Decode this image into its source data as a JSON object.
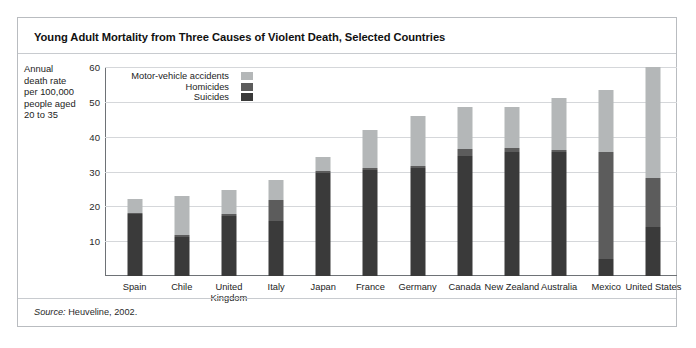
{
  "figure": {
    "title": "Young Adult Mortality from Three Causes of Violent Death, Selected Countries",
    "source_lead": "Source:",
    "source_text": " Heuveline, 2002."
  },
  "axis_caption": {
    "line1": "Annual",
    "line2": "death rate",
    "line3": "per 100,000",
    "line4": "people aged",
    "line5": "20 to 35"
  },
  "legend": {
    "items": [
      {
        "label": "Motor-vehicle accidents",
        "color": "#b4b7b8",
        "key": "motor"
      },
      {
        "label": "Homicides",
        "color": "#5c5c5c",
        "key": "homicides"
      },
      {
        "label": "Suicides",
        "color": "#3a3a3a",
        "key": "suicides"
      }
    ]
  },
  "chart_data": {
    "type": "bar",
    "subtype": "stacked-vertical",
    "title": "Young Adult Mortality from Three Causes of Violent Death, Selected Countries",
    "xlabel": "",
    "ylabel": "Annual death rate per 100,000 people aged 20 to 35",
    "ylim": [
      0,
      60
    ],
    "yticks": [
      10,
      20,
      30,
      40,
      50,
      60
    ],
    "ytick_labels": [
      "10",
      "20",
      "30",
      "40",
      "50",
      "60"
    ],
    "grid": true,
    "grid_axis": "y",
    "legend_position": "inside-top-left",
    "categories": [
      "Spain",
      "Chile",
      "United Kingdom",
      "Italy",
      "Japan",
      "France",
      "Germany",
      "Canada",
      "New Zealand",
      "Australia",
      "Mexico",
      "United States"
    ],
    "series": [
      {
        "name": "Suicides",
        "color": "#3a3a3a",
        "values": [
          17.7,
          11.3,
          17.3,
          15.7,
          29.7,
          30.3,
          31.0,
          34.5,
          35.7,
          35.7,
          5.0,
          14.0
        ]
      },
      {
        "name": "Homicides",
        "color": "#5c5c5c",
        "values": [
          0.5,
          0.5,
          0.5,
          6.0,
          0.5,
          0.7,
          0.5,
          2.0,
          1.0,
          0.5,
          30.5,
          14.0
        ]
      },
      {
        "name": "Motor-vehicle accidents",
        "color": "#b4b7b8",
        "values": [
          4.0,
          11.3,
          6.8,
          5.9,
          4.0,
          11.0,
          14.5,
          12.0,
          11.8,
          15.0,
          18.0,
          32.0
        ]
      }
    ],
    "totals": [
      22.2,
      23.1,
      24.6,
      27.6,
      34.2,
      42.0,
      46.0,
      48.5,
      48.5,
      51.2,
      53.5,
      60.0
    ]
  }
}
